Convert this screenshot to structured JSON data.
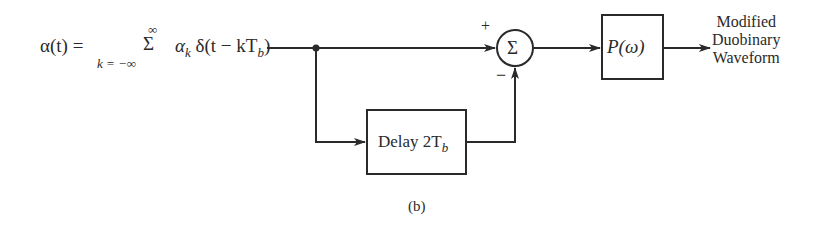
{
  "diagram": {
    "caption": "(b)",
    "input_signal": {
      "lhs": "α(t) =",
      "sum_symbol": "Σ",
      "sum_upper_limit": "∞",
      "sum_lower_limit": "k = −∞",
      "term_alpha": "α",
      "term_alpha_sub": "k",
      "term_delta": "δ(t − kT",
      "term_delta_sub": "b",
      "term_close": ")"
    },
    "summer": {
      "symbol": "Σ",
      "plus_sign": "+",
      "minus_sign": "−"
    },
    "delay_block": {
      "label_prefix": "Delay 2T",
      "label_sub": "b"
    },
    "filter_block": {
      "label": "P(ω)"
    },
    "output": {
      "line1": "Modified",
      "line2": "Duobinary",
      "line3": "Waveform"
    },
    "colors": {
      "stroke": "#2a2a2a",
      "background": "#ffffff"
    }
  }
}
